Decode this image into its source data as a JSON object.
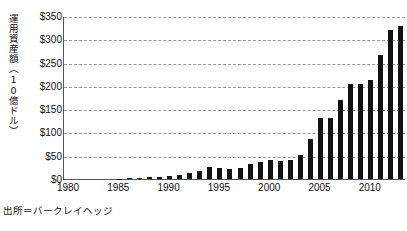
{
  "chart_data": {
    "type": "bar",
    "title": "",
    "subtitle": "",
    "xlabel": "",
    "ylabel": "運用資産額（10億ドル）",
    "ylim": [
      0,
      350
    ],
    "ytick_values": [
      0,
      50,
      100,
      150,
      200,
      250,
      300,
      350
    ],
    "ytick_labels": [
      "$0",
      "$50",
      "$100",
      "$150",
      "$200",
      "$250",
      "$300",
      "$350"
    ],
    "xtick_labels": [
      "1980",
      "1985",
      "1990",
      "1995",
      "2000",
      "2005",
      "2010"
    ],
    "grid": "horizontal-dashed",
    "legend": "none",
    "bar_color": "#111111",
    "categories": [
      "1980",
      "1981",
      "1982",
      "1983",
      "1984",
      "1985",
      "1986",
      "1987",
      "1988",
      "1989",
      "1990",
      "1991",
      "1992",
      "1993",
      "1994",
      "1995",
      "1996",
      "1997",
      "1998",
      "1999",
      "2000",
      "2001",
      "2002",
      "2003",
      "2004",
      "2005",
      "2006",
      "2007",
      "2008",
      "2009",
      "2010",
      "2011",
      "2012",
      "2013"
    ],
    "values": [
      0,
      0,
      0,
      0,
      0,
      1,
      2,
      3,
      4,
      5,
      6,
      9,
      13,
      18,
      25,
      23,
      22,
      24,
      33,
      36,
      41,
      38,
      41,
      51,
      86,
      131,
      130,
      170,
      205,
      205,
      213,
      267,
      319,
      329
    ],
    "values_last": 325,
    "units": "billions of USD",
    "source_note": "出所＝バークレイヘッジ"
  },
  "source": {
    "text": "出所＝バークレイヘッジ"
  },
  "axis": {
    "y_title": "運用資産額（10億ドル）"
  }
}
